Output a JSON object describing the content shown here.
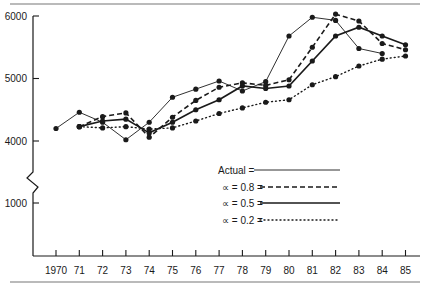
{
  "chart_data": {
    "type": "line",
    "title": "",
    "xlabel": "",
    "ylabel": "",
    "x": [
      "1970",
      "71",
      "72",
      "73",
      "74",
      "75",
      "76",
      "77",
      "78",
      "79",
      "80",
      "81",
      "82",
      "83",
      "84",
      "85"
    ],
    "yticks": [
      1000,
      4000,
      5000,
      6000
    ],
    "ytick_labels": [
      "1000",
      "4000",
      "5000",
      "6000"
    ],
    "axis_break": "between 1000 and 4000",
    "ylim": [
      0,
      6000
    ],
    "grid": false,
    "legend_position": "lower right inside plot",
    "series": [
      {
        "name": "Actual",
        "legend_label": "Actual =",
        "style": "solid-thin",
        "x": [
          "1970",
          "71",
          "72",
          "73",
          "74",
          "75",
          "76",
          "77",
          "78",
          "79",
          "80",
          "81",
          "82",
          "83",
          "84"
        ],
        "values": [
          4200,
          4460,
          4300,
          4020,
          4300,
          4700,
          4830,
          4960,
          4800,
          4950,
          5680,
          5980,
          5930,
          5480,
          5400
        ]
      },
      {
        "name": "α = 0.8",
        "legend_label": "∝ = 0.8 =",
        "style": "dashed",
        "x": [
          "71",
          "72",
          "73",
          "74",
          "75",
          "76",
          "77",
          "78",
          "79",
          "80",
          "81",
          "82",
          "83",
          "84",
          "85"
        ],
        "values": [
          4230,
          4390,
          4450,
          4060,
          4380,
          4650,
          4860,
          4930,
          4890,
          4980,
          5500,
          6030,
          5920,
          5560,
          5460
        ]
      },
      {
        "name": "α = 0.5",
        "legend_label": "∝ = 0.5 =",
        "style": "solid-thick",
        "x": [
          "71",
          "72",
          "73",
          "74",
          "75",
          "76",
          "77",
          "78",
          "79",
          "80",
          "81",
          "82",
          "83",
          "84",
          "85"
        ],
        "values": [
          4230,
          4320,
          4350,
          4130,
          4300,
          4500,
          4660,
          4880,
          4840,
          4880,
          5280,
          5680,
          5820,
          5680,
          5540
        ]
      },
      {
        "name": "α = 0.2",
        "legend_label": "∝ = 0.2 =",
        "style": "dotted",
        "x": [
          "71",
          "72",
          "73",
          "74",
          "75",
          "76",
          "77",
          "78",
          "79",
          "80",
          "81",
          "82",
          "83",
          "84",
          "85"
        ],
        "values": [
          4230,
          4210,
          4230,
          4190,
          4210,
          4320,
          4440,
          4530,
          4620,
          4660,
          4900,
          5030,
          5200,
          5310,
          5360
        ]
      }
    ]
  },
  "layout": {
    "line_color": "#1a1a1a",
    "rule_color": "#777777"
  }
}
